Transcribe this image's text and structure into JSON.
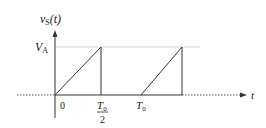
{
  "diagram": {
    "type": "waveform",
    "y_axis_label": {
      "main": "v",
      "sub": "S",
      "arg": "(t)"
    },
    "x_axis_label": "t",
    "level_label": {
      "main": "V",
      "sub": "A"
    },
    "ticks": {
      "zero": "0",
      "half_period_num": {
        "main": "T",
        "sub": "0"
      },
      "half_period_den": "2",
      "period": {
        "main": "T",
        "sub": "0"
      }
    },
    "colors": {
      "line": "#333333",
      "guide": "#cfcfcf",
      "dotted": "#555555"
    }
  }
}
